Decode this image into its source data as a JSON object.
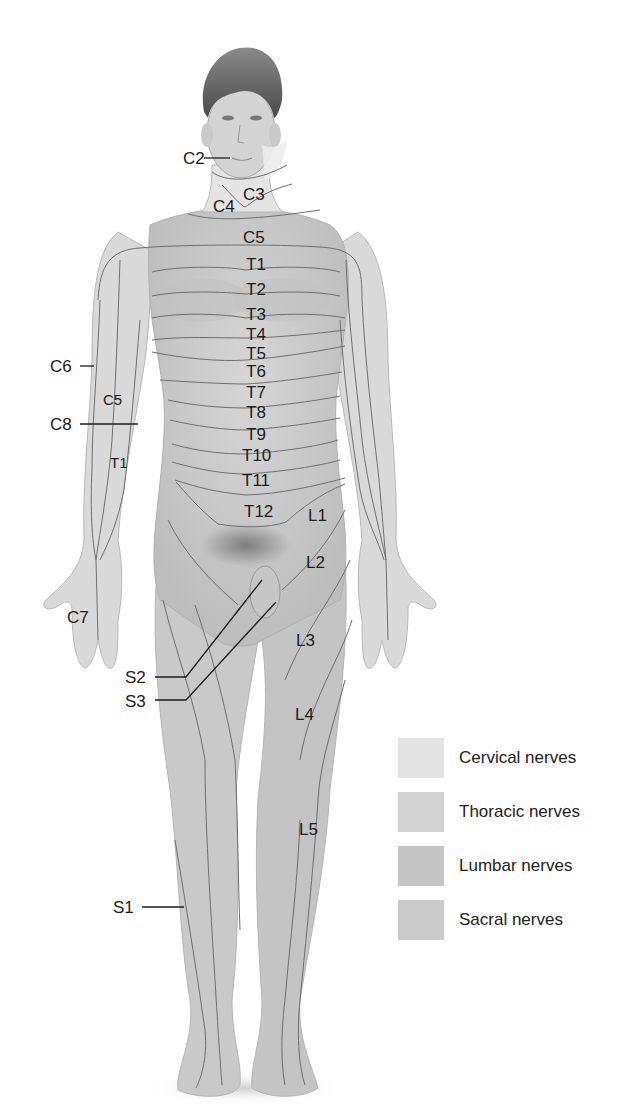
{
  "figure": {
    "skin_base": "#cfcfcf",
    "line_color": "#6e6e6e"
  },
  "labels": {
    "cervical": [
      {
        "id": "C2",
        "text": "C2",
        "x": 183,
        "y": 150,
        "leader": true
      },
      {
        "id": "C3",
        "text": "C3",
        "x": 243,
        "y": 186
      },
      {
        "id": "C4",
        "text": "C4",
        "x": 213,
        "y": 198
      },
      {
        "id": "C5",
        "text": "C5",
        "x": 243,
        "y": 229
      },
      {
        "id": "C6",
        "text": "C6",
        "x": 50,
        "y": 358,
        "leader": true
      },
      {
        "id": "C5-arm",
        "text": "C5",
        "x": 103,
        "y": 392,
        "small": true
      },
      {
        "id": "C8",
        "text": "C8",
        "x": 50,
        "y": 416,
        "leader": true
      },
      {
        "id": "C7",
        "text": "C7",
        "x": 67,
        "y": 609
      }
    ],
    "thoracic": [
      {
        "id": "T1",
        "text": "T1",
        "x": 246,
        "y": 256
      },
      {
        "id": "T2",
        "text": "T2",
        "x": 246,
        "y": 281
      },
      {
        "id": "T3",
        "text": "T3",
        "x": 246,
        "y": 306
      },
      {
        "id": "T4",
        "text": "T4",
        "x": 246,
        "y": 326
      },
      {
        "id": "T5",
        "text": "T5",
        "x": 246,
        "y": 345
      },
      {
        "id": "T6",
        "text": "T6",
        "x": 246,
        "y": 363
      },
      {
        "id": "T7",
        "text": "T7",
        "x": 246,
        "y": 384
      },
      {
        "id": "T8",
        "text": "T8",
        "x": 246,
        "y": 404
      },
      {
        "id": "T9",
        "text": "T9",
        "x": 246,
        "y": 426
      },
      {
        "id": "T10",
        "text": "T10",
        "x": 242,
        "y": 447
      },
      {
        "id": "T11",
        "text": "T11",
        "x": 242,
        "y": 472
      },
      {
        "id": "T12",
        "text": "T12",
        "x": 244,
        "y": 503
      },
      {
        "id": "T1-arm",
        "text": "T1",
        "x": 110,
        "y": 455,
        "small": true
      }
    ],
    "lumbar": [
      {
        "id": "L1",
        "text": "L1",
        "x": 308,
        "y": 507
      },
      {
        "id": "L2",
        "text": "L2",
        "x": 306,
        "y": 554
      },
      {
        "id": "L3",
        "text": "L3",
        "x": 296,
        "y": 632
      },
      {
        "id": "L4",
        "text": "L4",
        "x": 295,
        "y": 706
      },
      {
        "id": "L5",
        "text": "L5",
        "x": 299,
        "y": 821
      }
    ],
    "sacral": [
      {
        "id": "S1",
        "text": "S1",
        "x": 113,
        "y": 899,
        "leader": true
      },
      {
        "id": "S2",
        "text": "S2",
        "x": 125,
        "y": 669,
        "leader": true
      },
      {
        "id": "S3",
        "text": "S3",
        "x": 125,
        "y": 693,
        "leader": true
      }
    ]
  },
  "legend": {
    "items": [
      {
        "label": "Cervical nerves",
        "color": "#e3e3e3"
      },
      {
        "label": "Thoracic nerves",
        "color": "#d2d2d2"
      },
      {
        "label": "Lumbar nerves",
        "color": "#c4c4c4"
      },
      {
        "label": "Sacral nerves",
        "color": "#cbcbcb"
      }
    ]
  }
}
